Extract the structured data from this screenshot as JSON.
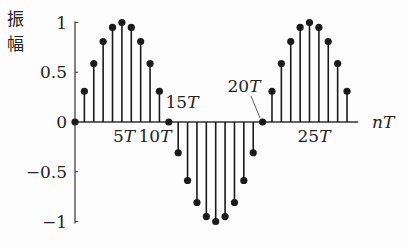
{
  "chart_data": {
    "type": "stem",
    "title": "",
    "ylabel": "振幅",
    "xlabel": "nT",
    "ylim": [
      -1,
      1
    ],
    "yticks": [
      1,
      0.5,
      0,
      -0.5,
      -1
    ],
    "ytick_labels": [
      "1",
      "0.5",
      "0",
      "−0.5",
      "−1"
    ],
    "xtick_labels": [
      {
        "n": 5,
        "label": "5T"
      },
      {
        "n": 10,
        "label": "10T"
      },
      {
        "n": 15,
        "label": "15T"
      },
      {
        "n": 20,
        "label": "20T"
      },
      {
        "n": 25,
        "label": "25T"
      }
    ],
    "x": [
      0,
      1,
      2,
      3,
      4,
      5,
      6,
      7,
      8,
      9,
      10,
      11,
      12,
      13,
      14,
      15,
      16,
      17,
      18,
      19,
      20,
      21,
      22,
      23,
      24,
      25,
      26,
      27,
      28,
      29
    ],
    "values": [
      0,
      0.309,
      0.588,
      0.809,
      0.951,
      1,
      0.951,
      0.809,
      0.588,
      0.309,
      0,
      -0.309,
      -0.588,
      -0.809,
      -0.951,
      -1,
      -0.951,
      -0.809,
      -0.588,
      -0.309,
      0,
      0.309,
      0.588,
      0.809,
      0.951,
      1,
      0.951,
      0.809,
      0.588,
      0.309
    ],
    "grid": false,
    "legend": null
  },
  "colors": {
    "stem": "#1a1a1a",
    "axis": "#333333",
    "background": "#fdfdfd"
  }
}
